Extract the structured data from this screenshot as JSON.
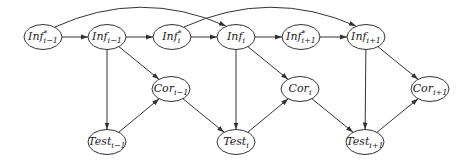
{
  "diagram": {
    "type": "dynamic-bayesian-network",
    "colors": {
      "stroke": "#333333",
      "fill": "#ffffff",
      "text": "#222222"
    },
    "nodes": [
      {
        "id": "infstar_im1",
        "base": "Inf",
        "sup": "*",
        "sub": "i−1",
        "x": 43,
        "y": 37
      },
      {
        "id": "inf_im1",
        "base": "Inf",
        "sup": "",
        "sub": "i−1",
        "x": 107,
        "y": 37
      },
      {
        "id": "infstar_i",
        "base": "Inf",
        "sup": "*",
        "sub": "i",
        "x": 172,
        "y": 37
      },
      {
        "id": "inf_i",
        "base": "Inf",
        "sup": "",
        "sub": "i",
        "x": 236,
        "y": 37
      },
      {
        "id": "infstar_ip1",
        "base": "Inf",
        "sup": "*",
        "sub": "i+1",
        "x": 301,
        "y": 37
      },
      {
        "id": "inf_ip1",
        "base": "Inf",
        "sup": "",
        "sub": "i+1",
        "x": 366,
        "y": 37
      },
      {
        "id": "cor_im1",
        "base": "Cor",
        "sup": "",
        "sub": "i−1",
        "x": 171,
        "y": 89
      },
      {
        "id": "cor_i",
        "base": "Cor",
        "sup": "",
        "sub": "i",
        "x": 300,
        "y": 89
      },
      {
        "id": "cor_ip1",
        "base": "Cor",
        "sup": "",
        "sub": "i+1",
        "x": 430,
        "y": 89
      },
      {
        "id": "test_im1",
        "base": "Test",
        "sup": "",
        "sub": "i−1",
        "x": 107,
        "y": 142
      },
      {
        "id": "test_i",
        "base": "Test",
        "sup": "",
        "sub": "i",
        "x": 236,
        "y": 142
      },
      {
        "id": "test_ip1",
        "base": "Test",
        "sup": "",
        "sub": "i+1",
        "x": 365,
        "y": 142
      }
    ],
    "edges": [
      {
        "from": "infstar_im1",
        "to": "inf_im1"
      },
      {
        "from": "inf_im1",
        "to": "infstar_i"
      },
      {
        "from": "infstar_i",
        "to": "inf_i"
      },
      {
        "from": "inf_i",
        "to": "infstar_ip1"
      },
      {
        "from": "infstar_ip1",
        "to": "inf_ip1"
      },
      {
        "from": "infstar_im1",
        "to": "inf_i",
        "curved": true
      },
      {
        "from": "infstar_i",
        "to": "inf_ip1",
        "curved": true
      },
      {
        "from": "inf_im1",
        "to": "cor_im1"
      },
      {
        "from": "inf_im1",
        "to": "test_im1"
      },
      {
        "from": "test_im1",
        "to": "cor_im1"
      },
      {
        "from": "cor_im1",
        "to": "test_i"
      },
      {
        "from": "inf_i",
        "to": "cor_i"
      },
      {
        "from": "inf_i",
        "to": "test_i"
      },
      {
        "from": "test_i",
        "to": "cor_i"
      },
      {
        "from": "cor_i",
        "to": "test_ip1"
      },
      {
        "from": "inf_ip1",
        "to": "cor_ip1"
      },
      {
        "from": "inf_ip1",
        "to": "test_ip1"
      },
      {
        "from": "test_ip1",
        "to": "cor_ip1"
      }
    ],
    "labels": {
      "infstar_im1": "Inf*i−1",
      "inf_im1": "Infi−1",
      "infstar_i": "Inf*i",
      "inf_i": "Infi",
      "infstar_ip1": "Inf*i+1",
      "inf_ip1": "Infi+1",
      "cor_im1": "Cori−1",
      "cor_i": "Cori",
      "cor_ip1": "Cori+1",
      "test_im1": "Testi−1",
      "test_i": "Testi",
      "test_ip1": "Testi+1"
    }
  }
}
